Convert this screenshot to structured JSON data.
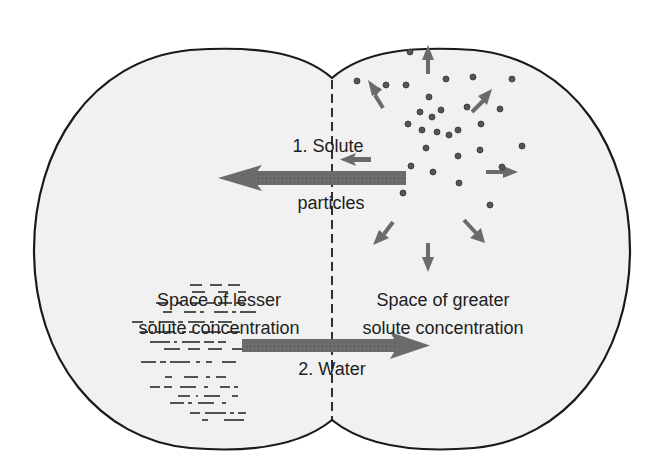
{
  "diagram": {
    "type": "diffusion-osmosis",
    "colors": {
      "background": "#ffffff",
      "cell_fill": "#f1f1f1",
      "outline": "#1a1a1a",
      "arrow": "#6b6b6b",
      "particle": "#555555",
      "text": "#1e1e1e"
    },
    "labels": {
      "solute_line1": "1. Solute",
      "solute_line2": "particles",
      "lesser_line1": "Space of lesser",
      "lesser_line2": "solute concentration",
      "greater_line1": "Space of greater",
      "greater_line2": "solute concentration",
      "water": "2. Water"
    },
    "regions": [
      {
        "name": "left-space",
        "description": "Space of lesser solute concentration"
      },
      {
        "name": "right-space",
        "description": "Space of greater solute concentration"
      }
    ],
    "flows": [
      {
        "step": 1,
        "label": "Solute particles",
        "direction": "right-to-left"
      },
      {
        "step": 2,
        "label": "Water",
        "direction": "left-to-right"
      }
    ]
  }
}
